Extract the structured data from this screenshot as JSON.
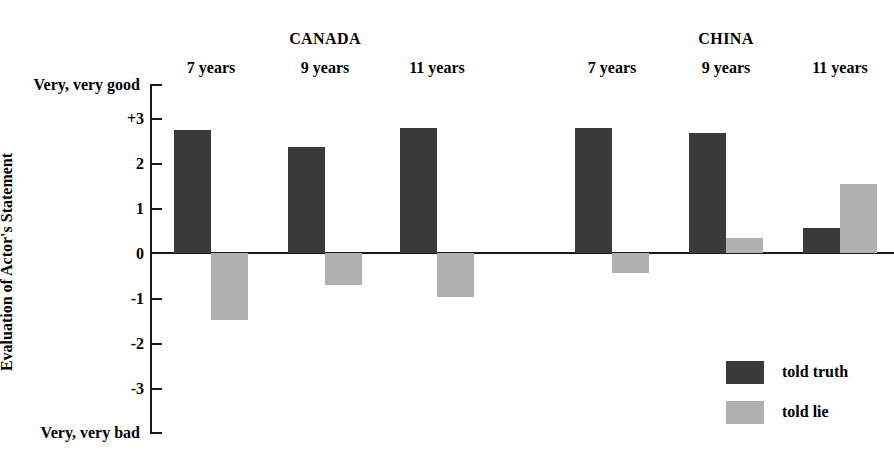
{
  "chart_data": {
    "type": "bar",
    "title": "",
    "subtitle": "",
    "xlabel": "",
    "ylabel": "Evaluation of Actor's Statement",
    "ylim": [
      -4,
      4
    ],
    "yticks": [
      3,
      2,
      1,
      0,
      -1,
      -2,
      -3
    ],
    "ytick_labels": [
      "+3",
      "2",
      "1",
      "0",
      "-1",
      "-2",
      "-3"
    ],
    "axis_top_caption": "Very, very good",
    "axis_bottom_caption": "Very, very bad",
    "grid": false,
    "legend_position": "lower right",
    "groups": [
      {
        "name": "CANADA",
        "categories": [
          "7 years",
          "9 years",
          "11 years"
        ]
      },
      {
        "name": "CHINA",
        "categories": [
          "7 years",
          "9 years",
          "11 years"
        ]
      }
    ],
    "categories": [
      "CANADA 7 years",
      "CANADA 9 years",
      "CANADA 11 years",
      "CHINA 7 years",
      "CHINA 9 years",
      "CHINA 11 years"
    ],
    "series": [
      {
        "name": "told truth",
        "color": "#3a3a3a",
        "values": [
          2.75,
          2.37,
          2.78,
          2.8,
          2.67,
          0.55
        ]
      },
      {
        "name": "told lie",
        "color": "#b0b0b0",
        "values": [
          -1.5,
          -0.72,
          -0.98,
          -0.44,
          0.34,
          1.53
        ]
      }
    ]
  },
  "axis": {
    "top_caption": "Very, very good",
    "bottom_caption": "Very, very bad",
    "title": "Evaluation of Actor's Statement",
    "ticks": [
      {
        "label": "+3",
        "value": 3
      },
      {
        "label": "2",
        "value": 2
      },
      {
        "label": "1",
        "value": 1
      },
      {
        "label": "0",
        "value": 0
      },
      {
        "label": "-1",
        "value": -1
      },
      {
        "label": "-2",
        "value": -2
      },
      {
        "label": "-3",
        "value": -3
      }
    ]
  },
  "groups": [
    {
      "name": "CANADA",
      "ages": [
        "7 years",
        "9 years",
        "11 years"
      ]
    },
    {
      "name": "CHINA",
      "ages": [
        "7 years",
        "9 years",
        "11 years"
      ]
    }
  ],
  "legend": {
    "items": [
      {
        "label": "told truth",
        "color": "#3a3a3a"
      },
      {
        "label": "told lie",
        "color": "#b0b0b0"
      }
    ]
  },
  "colors": {
    "truth": "#3a3a3a",
    "lie": "#b0b0b0",
    "axis": "#1a1a1a",
    "background": "#ffffff"
  }
}
